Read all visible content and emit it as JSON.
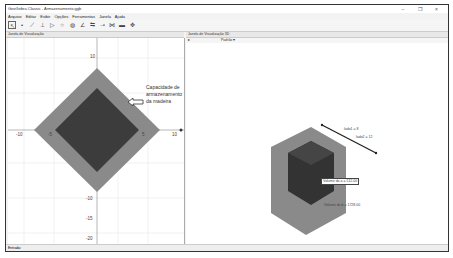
{
  "window": {
    "title": "GeoGebra Classic - Armazenamento.ggb",
    "controls": [
      "–",
      "❐",
      "×"
    ]
  },
  "menubar": {
    "items": [
      "Arquivo",
      "Editar",
      "Exibir",
      "Opções",
      "Ferramentas",
      "Janela",
      "Ajuda"
    ]
  },
  "toolbar": {
    "tools": [
      "move-tool",
      "point-tool",
      "line-tool",
      "perpendicular-tool",
      "polygon-tool",
      "circle-tool",
      "ellipse-tool",
      "angle-tool",
      "reflect-tool",
      "slider-tool",
      "text-tool",
      "abc-tool",
      "move-graphics-tool"
    ]
  },
  "graphics_view": {
    "header": "Janela de Visualização",
    "axis_labels": {
      "x_neg": "-10",
      "x_neg_small": "-5",
      "x_pos_small": "5",
      "x_pos": "10",
      "y_pos": "10",
      "y_neg_1": "-10",
      "y_neg_2": "-15",
      "y_neg_3": "-20"
    },
    "annotation": [
      "Capacidade de",
      "armazenamento",
      "da madeira"
    ],
    "colors": {
      "outer": "#8a8a8a",
      "inner": "#3c3c3c",
      "grid": "#e0e0e0"
    }
  },
  "view3d": {
    "header": "Janela de Visualização 3D",
    "toolbar_items": [
      "▸",
      "Padrão",
      "▾"
    ],
    "segment_labels": [
      "lado1 = 8",
      "lado2 = 12"
    ],
    "inner_label": "Volume da a = 512.00",
    "outer_label": "Volume da b = 1728.00",
    "colors": {
      "outer": "#8a8a8a",
      "inner": "#333333"
    }
  },
  "statusbar": {
    "input_label": "Entrada:"
  }
}
